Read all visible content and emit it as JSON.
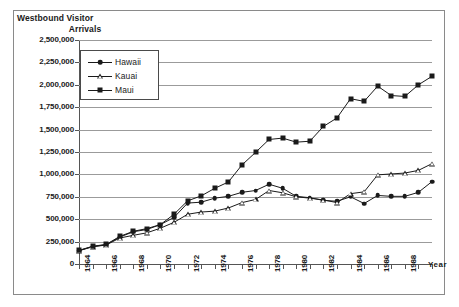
{
  "chart_data": {
    "type": "line",
    "title": "Westbound Visitor Arrivals",
    "title_line1": "Westbound Visitor",
    "title_line2": "Arrivals",
    "xlabel": "Year",
    "ylabel": "Westbound Visitor Arrivals",
    "ylim": [
      0,
      2500000
    ],
    "xlim": [
      1964,
      1990
    ],
    "grid": true,
    "legend_position": "upper-left-inside",
    "ytick_labels": [
      "2,500,000",
      "2,250,000",
      "2,000,000",
      "1,750,000",
      "1,500,000",
      "1,250,000",
      "1,000,000",
      "750,000",
      "500,000",
      "250,000",
      "0"
    ],
    "ytick_values": [
      2500000,
      2250000,
      2000000,
      1750000,
      1500000,
      1250000,
      1000000,
      750000,
      500000,
      250000,
      0
    ],
    "x": [
      1964,
      1965,
      1966,
      1967,
      1968,
      1969,
      1970,
      1971,
      1972,
      1973,
      1974,
      1975,
      1976,
      1977,
      1978,
      1979,
      1980,
      1981,
      1982,
      1983,
      1984,
      1985,
      1986,
      1987,
      1988,
      1989,
      1990
    ],
    "xtick_labels": [
      "1964",
      "",
      "1966",
      "",
      "1968",
      "",
      "1970",
      "",
      "1972",
      "",
      "1974",
      "",
      "1976",
      "",
      "1978",
      "",
      "1980",
      "",
      "1982",
      "",
      "1984",
      "",
      "1986",
      "",
      "1988",
      "",
      ""
    ],
    "series": [
      {
        "name": "Hawaii",
        "marker": "filled-circle",
        "color": "#1a1a1a",
        "values": [
          150000,
          195000,
          215000,
          300000,
          360000,
          385000,
          440000,
          520000,
          680000,
          690000,
          735000,
          755000,
          800000,
          820000,
          890000,
          845000,
          755000,
          740000,
          710000,
          700000,
          750000,
          675000,
          765000,
          755000,
          755000,
          800000,
          920000
        ]
      },
      {
        "name": "Kauai",
        "marker": "open-triangle",
        "color": "#1a1a1a",
        "values": [
          148000,
          192000,
          212000,
          290000,
          320000,
          348000,
          400000,
          465000,
          555000,
          580000,
          590000,
          625000,
          685000,
          720000,
          820000,
          795000,
          750000,
          735000,
          715000,
          685000,
          785000,
          805000,
          995000,
          1005000,
          1015000,
          1045000,
          1120000
        ]
      },
      {
        "name": "Maui",
        "marker": "filled-square",
        "color": "#1a1a1a",
        "values": [
          152000,
          198000,
          218000,
          308000,
          365000,
          395000,
          440000,
          555000,
          705000,
          760000,
          845000,
          915000,
          1105000,
          1245000,
          1390000,
          1405000,
          1360000,
          1370000,
          1535000,
          1630000,
          1845000,
          1815000,
          1985000,
          1880000,
          1870000,
          2000000,
          2095000
        ]
      }
    ]
  },
  "legend": {
    "items": [
      {
        "label": "Hawaii",
        "marker": "filled-circle"
      },
      {
        "label": "Kauai",
        "marker": "open-triangle"
      },
      {
        "label": "Maui",
        "marker": "filled-square"
      }
    ]
  }
}
